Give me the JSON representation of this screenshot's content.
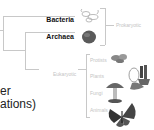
{
  "tree": {
    "domains": [
      {
        "label": "Bacteria",
        "style": "bold"
      },
      {
        "label": "Archaea",
        "style": "bold"
      }
    ],
    "groups": [
      {
        "label": "Prokaryotic",
        "members": [
          "Bacteria",
          "Archaea"
        ]
      },
      {
        "label": "Eukaryotic",
        "members": [
          "Protists",
          "Plants",
          "Fungi",
          "Animals"
        ]
      }
    ],
    "eukaryote_kingdoms": [
      {
        "label": "Protists",
        "icon": "protist-icon"
      },
      {
        "label": "Plants",
        "icon": "plant-icon"
      },
      {
        "label": "Fungi",
        "icon": "mushroom-icon"
      },
      {
        "label": "Animals",
        "icon": "butterfly-icon"
      }
    ]
  },
  "cut_text": {
    "line1": "er",
    "line2": "ations)"
  },
  "colors": {
    "branch": "#c8c8c8",
    "faint_label": "#c4c4c4",
    "bold_label": "#111111"
  }
}
